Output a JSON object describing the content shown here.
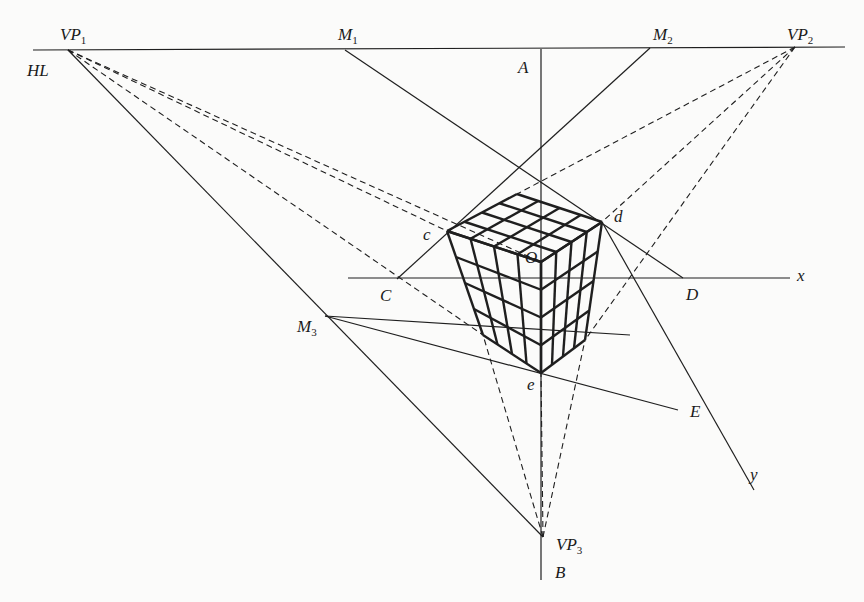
{
  "diagram": {
    "title": "Three-point perspective construction of a cube",
    "colors": {
      "ink": "#1f1f1f",
      "background": "#fbfbfa"
    },
    "points": {
      "VP1": [
        68,
        50
      ],
      "VP2": [
        795,
        47
      ],
      "VP3": [
        543,
        537
      ],
      "M1": [
        345,
        50
      ],
      "M2": [
        650,
        48
      ],
      "M3": [
        325,
        316
      ],
      "A": [
        541,
        49
      ],
      "B": [
        541,
        580
      ],
      "c": [
        447,
        231
      ],
      "d": [
        602,
        222
      ],
      "O": [
        541,
        262
      ],
      "e": [
        541,
        373
      ],
      "T": [
        517,
        194
      ],
      "L": [
        483,
        335
      ],
      "R": [
        585,
        340
      ],
      "C": [
        397,
        279
      ],
      "D": [
        683,
        278
      ],
      "E": [
        678,
        410
      ],
      "yEnd": [
        754,
        490
      ],
      "xStart": [
        348,
        278
      ],
      "xEnd": [
        790,
        278
      ]
    },
    "labels": [
      {
        "id": "VP1",
        "text": "VP",
        "sub": "1",
        "x": 60,
        "y": 40
      },
      {
        "id": "HL",
        "text": "HL",
        "sub": "",
        "x": 27,
        "y": 76
      },
      {
        "id": "M1",
        "text": "M",
        "sub": "1",
        "x": 338,
        "y": 40
      },
      {
        "id": "A",
        "text": "A",
        "sub": "",
        "x": 518,
        "y": 73
      },
      {
        "id": "M2",
        "text": "M",
        "sub": "2",
        "x": 653,
        "y": 40
      },
      {
        "id": "VP2",
        "text": "VP",
        "sub": "2",
        "x": 787,
        "y": 40
      },
      {
        "id": "c",
        "text": "c",
        "sub": "",
        "x": 423,
        "y": 240
      },
      {
        "id": "d",
        "text": "d",
        "sub": "",
        "x": 614,
        "y": 222
      },
      {
        "id": "O",
        "text": "O",
        "sub": "",
        "x": 525,
        "y": 263
      },
      {
        "id": "x",
        "text": "x",
        "sub": "",
        "x": 797,
        "y": 281
      },
      {
        "id": "C",
        "text": "C",
        "sub": "",
        "x": 380,
        "y": 301
      },
      {
        "id": "D",
        "text": "D",
        "sub": "",
        "x": 686,
        "y": 300
      },
      {
        "id": "M3",
        "text": "M",
        "sub": "3",
        "x": 297,
        "y": 332
      },
      {
        "id": "e",
        "text": "e",
        "sub": "",
        "x": 527,
        "y": 390
      },
      {
        "id": "E",
        "text": "E",
        "sub": "",
        "x": 690,
        "y": 417
      },
      {
        "id": "y",
        "text": "y",
        "sub": "",
        "x": 750,
        "y": 480
      },
      {
        "id": "VP3",
        "text": "VP",
        "sub": "3",
        "x": 556,
        "y": 550
      },
      {
        "id": "B",
        "text": "B",
        "sub": "",
        "x": 555,
        "y": 578
      }
    ],
    "solid_lines": [
      [
        "HL0",
        "HL1"
      ],
      [
        "A",
        "B"
      ],
      [
        "VP1",
        "VP3"
      ],
      [
        "M1",
        "D"
      ],
      [
        "M2",
        "C"
      ],
      [
        "xStart",
        "xEnd"
      ],
      [
        "M3",
        "E"
      ],
      [
        "d",
        "yEnd"
      ],
      [
        "M3",
        "e2"
      ]
    ],
    "extra_points": {
      "HL0": [
        33,
        50
      ],
      "HL1": [
        845,
        47
      ],
      "e2": [
        630,
        335
      ]
    },
    "dashed_lines": [
      [
        "VP1",
        "c"
      ],
      [
        "VP1",
        "O"
      ],
      [
        "VP1",
        "L"
      ],
      [
        "VP2",
        "T"
      ],
      [
        "VP2",
        "d"
      ],
      [
        "VP2",
        "R"
      ],
      [
        "VP3",
        "L"
      ],
      [
        "VP3",
        "e"
      ],
      [
        "VP3",
        "R"
      ]
    ],
    "cube_grid": 4
  }
}
